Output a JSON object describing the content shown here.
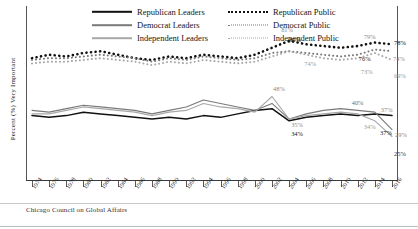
{
  "axis": {
    "ylabel": "Percent (%) Very Important",
    "ymin": 0,
    "ymax": 100,
    "xmin": 1974,
    "xmax": 2016
  },
  "legend": {
    "left": [
      {
        "label": "Republican Leaders",
        "swatch": "solid-line-black",
        "color": "#111111",
        "style": "solid"
      },
      {
        "label": "Democrat Leaders",
        "swatch": "solid-line-dark-gray",
        "color": "#7a7a7a",
        "style": "solid"
      },
      {
        "label": "Independent Leaders",
        "swatch": "solid-line-light-gray",
        "color": "#a8a8a8",
        "style": "solid"
      }
    ],
    "right": [
      {
        "label": "Republican Public",
        "swatch": "dotted-line-black",
        "color": "#111111",
        "style": "dotted"
      },
      {
        "label": "Democrat Public",
        "swatch": "dotted-line-dark-gray",
        "color": "#7a7a7a",
        "style": "dotted"
      },
      {
        "label": "Independent Public",
        "swatch": "dotted-line-light-gray",
        "color": "#a8a8a8",
        "style": "dotted"
      }
    ]
  },
  "footer": {
    "source": "Chicago Council on Global Affairs"
  },
  "chart_data": {
    "type": "line",
    "title": "",
    "xlabel": "",
    "ylabel": "Percent (%) Very Important",
    "xlim": [
      1974,
      2016
    ],
    "ylim": [
      0,
      100
    ],
    "grid": false,
    "legend_position": "top",
    "x": [
      1974,
      1976,
      1978,
      1980,
      1982,
      1984,
      1986,
      1988,
      1990,
      1992,
      1994,
      1996,
      1998,
      2000,
      2002,
      2004,
      2006,
      2008,
      2010,
      2012,
      2014,
      2016
    ],
    "tick_labels": [
      "1974",
      "1976",
      "1978",
      "1980",
      "1982",
      "1984",
      "1986",
      "1988",
      "1990",
      "1992",
      "1994",
      "1996",
      "1998",
      "2000",
      "2002",
      "2004",
      "2006",
      "2008",
      "2010",
      "2012",
      "2014",
      "2016"
    ],
    "series": [
      {
        "name": "Republican Public",
        "style": "dotted",
        "color": "#111111",
        "values": [
          70,
          72,
          71,
          73,
          74,
          72,
          70,
          69,
          71,
          70,
          72,
          71,
          70,
          72,
          76,
          80,
          78,
          77,
          76,
          77,
          79,
          78
        ],
        "end_label": "78%"
      },
      {
        "name": "Democrat Public",
        "style": "dotted",
        "color": "#7a7a7a",
        "values": [
          69,
          70,
          70,
          71,
          72,
          71,
          70,
          68,
          70,
          69,
          71,
          70,
          69,
          70,
          73,
          74,
          73,
          72,
          71,
          72,
          75,
          74
        ],
        "end_label": "74%"
      },
      {
        "name": "Independent Public",
        "style": "dotted",
        "color": "#a8a8a8",
        "values": [
          67,
          68,
          68,
          69,
          70,
          69,
          68,
          66,
          68,
          67,
          69,
          68,
          67,
          68,
          71,
          74,
          72,
          70,
          69,
          70,
          73,
          69
        ],
        "end_label": "69%"
      },
      {
        "name": "Republican Leaders",
        "style": "solid",
        "color": "#111111",
        "values": [
          37,
          36,
          37,
          39,
          38,
          37,
          36,
          35,
          36,
          35,
          37,
          36,
          38,
          40,
          41,
          34,
          36,
          37,
          38,
          37,
          38,
          37
        ],
        "end_label": "37%"
      },
      {
        "name": "Democrat Leaders",
        "style": "solid",
        "color": "#7a7a7a",
        "values": [
          40,
          39,
          41,
          43,
          42,
          41,
          40,
          38,
          40,
          42,
          46,
          44,
          42,
          40,
          44,
          35,
          38,
          40,
          41,
          40,
          39,
          29
        ],
        "end_label": "29%"
      },
      {
        "name": "Independent Leaders",
        "style": "solid",
        "color": "#a8a8a8",
        "values": [
          38,
          38,
          40,
          42,
          41,
          40,
          39,
          37,
          39,
          40,
          44,
          42,
          41,
          39,
          48,
          35,
          37,
          38,
          39,
          38,
          34,
          25
        ],
        "end_label": "25%"
      }
    ],
    "point_labels": [
      {
        "text": "81%",
        "series": "Republican Public",
        "x": 2004,
        "value": 81,
        "color": "#8a8a8a"
      },
      {
        "text": "80%",
        "series": "Republican Public",
        "x": 2004,
        "value": 80,
        "color": "#1a1a1a"
      },
      {
        "text": "74%",
        "series": "Independent Public",
        "x": 2006,
        "value": 74,
        "color": "#9a9a9a"
      },
      {
        "text": "79%",
        "series": "Republican Public",
        "x": 2014,
        "value": 79,
        "color": "#8a8a8a"
      },
      {
        "text": "78%",
        "series": "Republican Public",
        "x": 2016,
        "value": 78,
        "color": "#111111"
      },
      {
        "text": "74%",
        "series": "Democrat Public",
        "x": 2016,
        "value": 74,
        "color": "#8f8f8f"
      },
      {
        "text": "76%",
        "series": "Democrat Public",
        "x": 2014,
        "value": 76,
        "color": "#1a1a1a"
      },
      {
        "text": "73%",
        "series": "Independent Public",
        "x": 2014,
        "value": 73,
        "color": "#9a9a9a"
      },
      {
        "text": "69%",
        "series": "Independent Public",
        "x": 2016,
        "value": 69,
        "color": "#9a9a9a"
      },
      {
        "text": "48%",
        "series": "Independent Leaders",
        "x": 2002,
        "value": 48,
        "color": "#8a8a8a"
      },
      {
        "text": "35%",
        "series": "Democrat Leaders",
        "x": 2004,
        "value": 35,
        "color": "#8a8a8a"
      },
      {
        "text": "34%",
        "series": "Republican Leaders",
        "x": 2004,
        "value": 34,
        "color": "#1a1a1a"
      },
      {
        "text": "40%",
        "series": "Democrat Leaders",
        "x": 2012,
        "value": 40,
        "color": "#6f6f6f"
      },
      {
        "text": "37%",
        "series": "Republican Leaders",
        "x": 2014,
        "value": 37,
        "color": "#8a8a8a"
      },
      {
        "text": "34%",
        "series": "Independent Leaders",
        "x": 2014,
        "value": 34,
        "color": "#9a9a9a"
      },
      {
        "text": "29%",
        "series": "Democrat Leaders",
        "x": 2016,
        "value": 29,
        "color": "#8a8a8a"
      },
      {
        "text": "37%",
        "series": "Republican Leaders",
        "x": 2016,
        "value": 37,
        "color": "#111111"
      },
      {
        "text": "25%",
        "series": "Independent Leaders",
        "x": 2016,
        "value": 25,
        "color": "#333333"
      }
    ]
  }
}
